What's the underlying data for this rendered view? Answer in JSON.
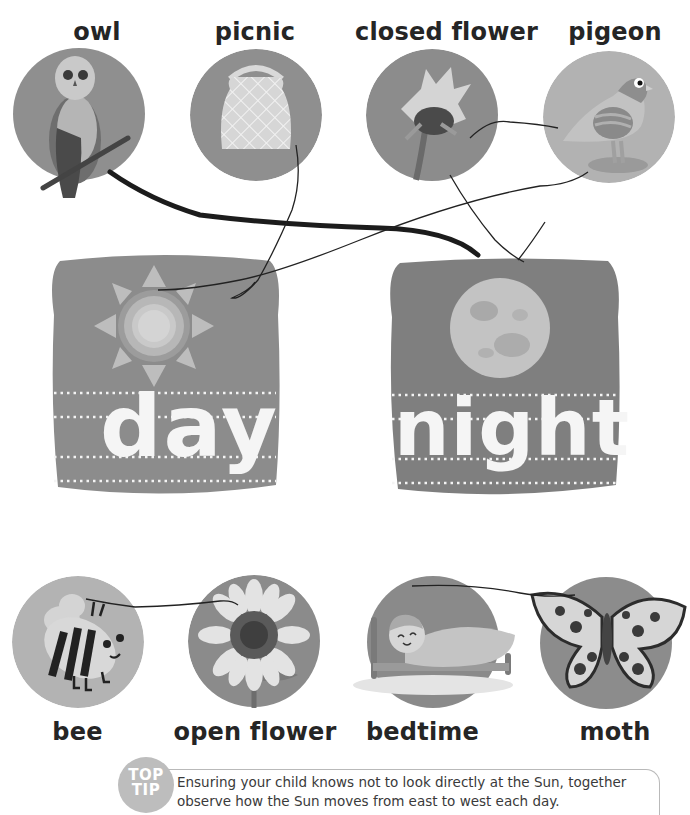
{
  "worksheet": {
    "top_row": [
      {
        "label": "owl",
        "icon": "owl-photo-icon"
      },
      {
        "label": "picnic",
        "icon": "picnic-basket-icon"
      },
      {
        "label": "closed flower",
        "icon": "closed-sunflower-icon"
      },
      {
        "label": "pigeon",
        "icon": "pigeon-icon"
      }
    ],
    "cards": [
      {
        "word": "day",
        "icon": "sun-icon"
      },
      {
        "word": "night",
        "icon": "moon-icon"
      }
    ],
    "bottom_row": [
      {
        "label": "bee",
        "icon": "bee-icon"
      },
      {
        "label": "open flower",
        "icon": "sunflower-icon"
      },
      {
        "label": "bedtime",
        "icon": "child-in-bed-icon"
      },
      {
        "label": "moth",
        "icon": "moth-icon"
      }
    ]
  },
  "tip": {
    "badge_line1": "TOP",
    "badge_line2": "TIP",
    "text": "Ensuring your child knows not to look directly at the Sun, together observe how the Sun moves from east to west each day."
  },
  "colors": {
    "circle_dark": "#8d8d8d",
    "circle_mid": "#a8a8a8",
    "circle_light": "#bdbdbd",
    "card": "#8a8a8a",
    "drawn_line": "#1c1c1c"
  }
}
